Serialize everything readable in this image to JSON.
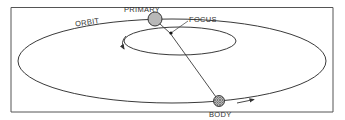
{
  "diagram": {
    "labels": {
      "orbit": "ORBIT",
      "primary": "PRIMARY",
      "focus": "FOCUS",
      "body": "BODY"
    },
    "colors": {
      "line": "#3a3a3a",
      "primary_fill": "#b8b8b8",
      "focus_dot": "#111111",
      "frame": "#555555",
      "background": "#ffffff"
    },
    "elements": [
      {
        "id": "outer-orbit",
        "type": "ellipse",
        "label": "ORBIT"
      },
      {
        "id": "inner-orbit",
        "type": "ellipse"
      },
      {
        "id": "primary",
        "type": "circle",
        "label": "PRIMARY"
      },
      {
        "id": "focus",
        "type": "point",
        "label": "FOCUS"
      },
      {
        "id": "body",
        "type": "circle-hatched",
        "label": "BODY"
      },
      {
        "id": "radius-line",
        "from": "focus",
        "to": "body"
      },
      {
        "id": "direction-arrow-outer",
        "type": "arrow"
      },
      {
        "id": "direction-arrow-inner",
        "type": "arrow"
      }
    ]
  }
}
